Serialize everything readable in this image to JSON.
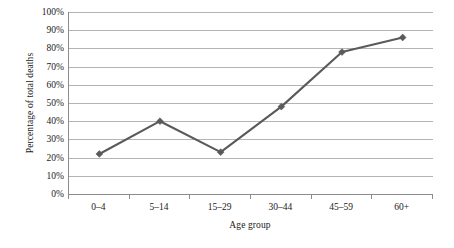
{
  "chart_data": {
    "type": "line",
    "title": "",
    "xlabel": "Age group",
    "ylabel": "Percentage of total deaths",
    "categories": [
      "0–4",
      "5–14",
      "15–29",
      "30–44",
      "45–59",
      "60+"
    ],
    "values": [
      22,
      40,
      23,
      48,
      78,
      86
    ],
    "ylim": [
      0,
      100
    ],
    "ytick_labels": [
      "100%",
      "90%",
      "80%",
      "70%",
      "60%",
      "50%",
      "40%",
      "30%",
      "20%",
      "10%",
      "0%"
    ],
    "ytick_values": [
      100,
      90,
      80,
      70,
      60,
      50,
      40,
      30,
      20,
      10,
      0
    ],
    "grid": true,
    "legend": false,
    "series": [
      {
        "name": "Percentage of total deaths",
        "values": [
          22,
          40,
          23,
          48,
          78,
          86
        ],
        "color": "#5a5a5a",
        "marker": "diamond"
      }
    ],
    "colors": {
      "line": "#5a5a5a",
      "marker": "#5a5a5a",
      "gridline": "#b4b4b4",
      "axis": "#8c8c8c",
      "background": "#ffffff",
      "text": "#1a1a1a"
    }
  }
}
